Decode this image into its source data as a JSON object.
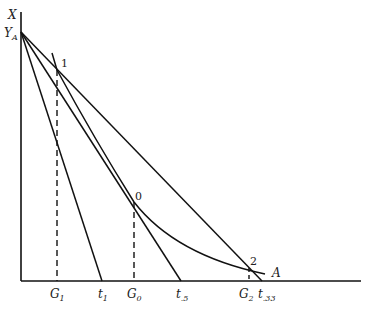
{
  "diagram": {
    "axis_labels": {
      "y_axis": "X",
      "y_intercept": "Y",
      "y_intercept_sub": "A"
    },
    "points": [
      {
        "label": "1",
        "x": 57,
        "y": 70
      },
      {
        "label": "0",
        "x": 134,
        "y": 202
      },
      {
        "label": "2",
        "x": 249,
        "y": 268
      }
    ],
    "curve_label": "A",
    "x_ticks": [
      {
        "main": "G",
        "sub": "1"
      },
      {
        "main": "t",
        "sub": "1"
      },
      {
        "main": "G",
        "sub": "0"
      },
      {
        "main": "t",
        "sub": ".5"
      },
      {
        "main": "G",
        "sub": "2"
      },
      {
        "main": "t",
        "sub": ".33"
      }
    ]
  }
}
